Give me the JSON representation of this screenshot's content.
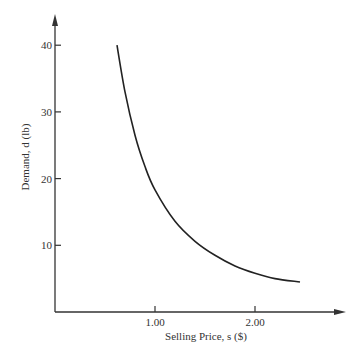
{
  "chart_data": {
    "type": "line",
    "title": "",
    "xlabel": "Selling Price, s ($)",
    "ylabel": "Demand, d (lb)",
    "xlim": [
      0,
      2.9
    ],
    "ylim": [
      0,
      44
    ],
    "x_ticks": [
      1.0,
      2.0
    ],
    "x_tick_labels": [
      "1.00",
      "2.00"
    ],
    "y_ticks": [
      10,
      20,
      30,
      40
    ],
    "y_tick_labels": [
      "10",
      "20",
      "30",
      "40"
    ],
    "grid": false,
    "legend": null,
    "series": [
      {
        "name": "demand curve",
        "x": [
          0.62,
          0.7,
          0.8,
          0.9,
          1.0,
          1.2,
          1.4,
          1.6,
          1.8,
          2.0,
          2.2,
          2.45
        ],
        "y": [
          40.0,
          33.0,
          26.5,
          21.8,
          18.3,
          13.6,
          10.6,
          8.5,
          6.9,
          5.8,
          5.0,
          4.5
        ]
      }
    ]
  }
}
